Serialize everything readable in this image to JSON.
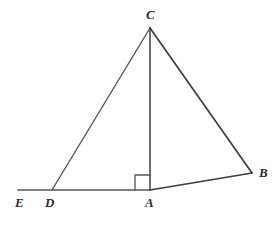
{
  "figure": {
    "type": "geometry-diagram",
    "canvas": {
      "width": 277,
      "height": 226
    },
    "background_color": "#ffffff",
    "stroke_color": "#565656",
    "stroke_color_dark": "#3d3d3d",
    "label_color": "#2b2b2b",
    "points": [
      {
        "id": "E",
        "label": "E",
        "x": 18,
        "y": 190,
        "label_x": 15,
        "label_y": 196
      },
      {
        "id": "D",
        "label": "D",
        "x": 52,
        "y": 190,
        "label_x": 45,
        "label_y": 196
      },
      {
        "id": "A",
        "label": "A",
        "x": 150,
        "y": 190,
        "label_x": 145,
        "label_y": 196
      },
      {
        "id": "C",
        "label": "C",
        "x": 150,
        "y": 28,
        "label_x": 146,
        "label_y": 8
      },
      {
        "id": "B",
        "label": "B",
        "x": 252,
        "y": 173,
        "label_x": 259,
        "label_y": 166
      }
    ],
    "segments": [
      {
        "id": "baseline-ED-A",
        "from": "E",
        "to": "A",
        "x1": 18,
        "y1": 190,
        "x2": 150,
        "y2": 190,
        "width": 1.4,
        "color": "#565656"
      },
      {
        "id": "segment-DC",
        "from": "D",
        "to": "C",
        "x1": 52,
        "y1": 190,
        "x2": 150,
        "y2": 28,
        "width": 1.4,
        "color": "#565656"
      },
      {
        "id": "segment-CA",
        "from": "C",
        "to": "A",
        "x1": 150,
        "y1": 28,
        "x2": 150,
        "y2": 190,
        "width": 1.6,
        "color": "#4a4a4a"
      },
      {
        "id": "segment-CB",
        "from": "C",
        "to": "B",
        "x1": 150,
        "y1": 28,
        "x2": 252,
        "y2": 173,
        "width": 1.7,
        "color": "#3d3d3d"
      },
      {
        "id": "segment-AB",
        "from": "A",
        "to": "B",
        "x1": 150,
        "y1": 190,
        "x2": 252,
        "y2": 173,
        "width": 1.7,
        "color": "#3d3d3d"
      }
    ],
    "right_angle_marker": {
      "id": "right-angle-at-A",
      "at_point": "A",
      "size": 15,
      "x": 135,
      "y": 175,
      "color": "#565656",
      "width": 1.3,
      "note": "right angle between CA and the base line, drawn on the D side of A"
    }
  }
}
